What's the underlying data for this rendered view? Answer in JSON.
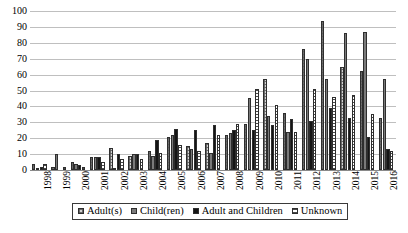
{
  "chart_data": {
    "type": "bar",
    "title": "",
    "xlabel": "",
    "ylabel": "",
    "ylim": [
      0,
      100
    ],
    "ytick_step": 10,
    "yticks": [
      0,
      10,
      20,
      30,
      40,
      50,
      60,
      70,
      80,
      90,
      100
    ],
    "grid": true,
    "legend_position": "bottom",
    "categories": [
      "1998",
      "1999",
      "2000",
      "2001",
      "2002",
      "2003",
      "2004",
      "2005",
      "2006",
      "2007",
      "2008",
      "2009",
      "2010",
      "2011",
      "2012",
      "2013",
      "2014",
      "2015",
      "2016"
    ],
    "series": [
      {
        "name": "Adult(s)",
        "pattern": "checkered-light",
        "color": "#d2d2d2",
        "values": [
          4,
          2,
          5,
          8,
          14,
          9,
          12,
          21,
          15,
          17,
          22,
          29,
          57,
          36,
          76,
          94,
          65,
          62,
          33
        ]
      },
      {
        "name": "Child(ren)",
        "pattern": "solid-gray",
        "color": "#7a7a7a",
        "values": [
          1,
          10,
          4,
          8,
          1,
          10,
          9,
          22,
          13,
          11,
          23,
          45,
          34,
          24,
          70,
          57,
          86,
          87,
          57
        ]
      },
      {
        "name": "Adult and Children",
        "pattern": "solid-black",
        "color": "#151515",
        "values": [
          2,
          0,
          3,
          8,
          10,
          10,
          19,
          26,
          25,
          28,
          25,
          25,
          28,
          32,
          31,
          39,
          33,
          21,
          13
        ]
      },
      {
        "name": "Unknown",
        "pattern": "horizontal-stripes",
        "color": "#ffffff",
        "values": [
          4,
          2,
          2,
          5,
          7,
          7,
          11,
          16,
          12,
          22,
          29,
          51,
          41,
          24,
          51,
          46,
          47,
          35,
          12
        ]
      }
    ]
  },
  "legend": {
    "items": [
      {
        "label": "Adult(s)"
      },
      {
        "label": "Child(ren)"
      },
      {
        "label": "Adult and Children"
      },
      {
        "label": "Unknown"
      }
    ]
  }
}
